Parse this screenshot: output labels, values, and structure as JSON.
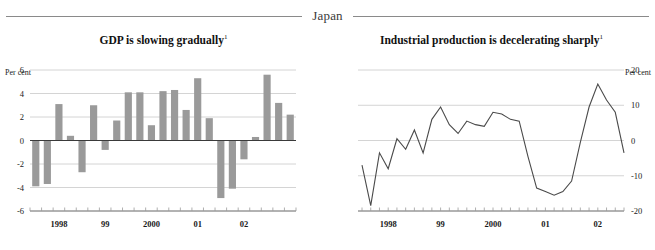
{
  "header": {
    "title": "Japan"
  },
  "panels": [
    {
      "id": "gdp",
      "title": "GDP is slowing gradually",
      "title_superscript": "1",
      "units_label": "Per cent",
      "units_position": "left"
    },
    {
      "id": "industrial-production",
      "title": "Industrial production is decelerating sharply",
      "title_superscript": "1",
      "units_label": "Per cent",
      "units_position": "right"
    }
  ],
  "chart_data": [
    {
      "type": "bar",
      "id": "gdp",
      "title": "GDP is slowing gradually",
      "xlabel": "",
      "ylabel": "Per cent",
      "ylim": [
        -6,
        6
      ],
      "yticks": [
        6,
        4,
        2,
        0,
        -2,
        -4,
        -6
      ],
      "ytick_labels": [
        "6",
        "4",
        "2",
        "0",
        "-2",
        "-4",
        "-6"
      ],
      "grid": true,
      "legend": "none",
      "x_axis_labels": [
        "1998",
        "99",
        "2000",
        "01",
        "02"
      ],
      "x_label_positions": [
        2.0,
        6.0,
        10.0,
        14.0,
        18.0
      ],
      "categories": [
        "1997Q3",
        "1997Q4",
        "1998Q1",
        "1998Q2",
        "1998Q3",
        "1998Q4",
        "1999Q1",
        "1999Q2",
        "1999Q3",
        "1999Q4",
        "2000Q1",
        "2000Q2",
        "2000Q3",
        "2000Q4",
        "2001Q1",
        "2001Q2",
        "2001Q3",
        "2001Q4",
        "2002Q1",
        "2002Q2",
        "2002Q3",
        "2002Q4"
      ],
      "values": [
        -3.9,
        -3.7,
        3.1,
        0.4,
        -2.7,
        3.0,
        -0.8,
        1.7,
        4.1,
        4.1,
        1.3,
        4.2,
        4.3,
        2.6,
        5.3,
        1.9,
        -4.9,
        -4.1,
        -1.6,
        0.3,
        5.6,
        3.2,
        2.2
      ],
      "bar_color": "#9a9a9a"
    },
    {
      "type": "line",
      "id": "industrial-production",
      "title": "Industrial production is decelerating sharply",
      "xlabel": "",
      "ylabel": "Per cent",
      "ylim": [
        -20,
        20
      ],
      "yticks": [
        20,
        10,
        0,
        -10,
        -20
      ],
      "ytick_labels": [
        "20",
        "10",
        "0",
        "-10",
        "-20"
      ],
      "grid": true,
      "legend": "none",
      "x_axis_labels": [
        "1998",
        "99",
        "2000",
        "01",
        "02"
      ],
      "x_label_positions": [
        3.0,
        9.0,
        15.0,
        21.0,
        27.0
      ],
      "series": [
        {
          "name": "Industrial production growth",
          "color": "#4a4a4a",
          "x": [
            0,
            1,
            2,
            3,
            4,
            5,
            6,
            7,
            8,
            9,
            10,
            11,
            12,
            13,
            14,
            15,
            16,
            17,
            18,
            19,
            20,
            21,
            22,
            23,
            24,
            25,
            26,
            27,
            28,
            29,
            30
          ],
          "values": [
            -7.0,
            -18.5,
            -3.5,
            -8.0,
            0.5,
            -2.5,
            3.0,
            -3.5,
            6.0,
            9.5,
            4.5,
            2.0,
            5.5,
            4.5,
            4.0,
            8.0,
            7.5,
            6.0,
            5.5,
            -4.5,
            -13.5,
            -14.5,
            -15.5,
            -14.5,
            -11.5,
            -0.5,
            9.5,
            16.0,
            11.5,
            8.0,
            -3.5
          ]
        }
      ]
    }
  ]
}
